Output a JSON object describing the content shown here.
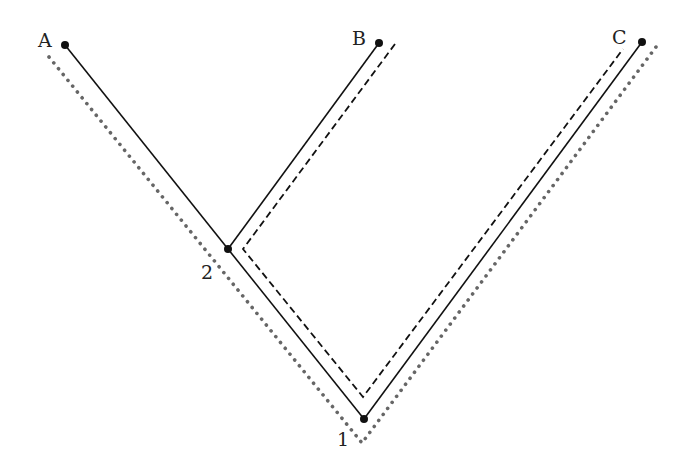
{
  "diagram": {
    "type": "phylogenetic-tree",
    "leaves": [
      {
        "id": "A",
        "label": "A",
        "x": 65,
        "y": 45
      },
      {
        "id": "B",
        "label": "B",
        "x": 379,
        "y": 43
      },
      {
        "id": "C",
        "label": "C",
        "x": 642,
        "y": 42
      }
    ],
    "internal_nodes": [
      {
        "id": "2",
        "label": "2",
        "x": 228,
        "y": 249
      },
      {
        "id": "1",
        "label": "1",
        "x": 364,
        "y": 419
      }
    ],
    "edges": [
      {
        "from": "1",
        "to": "2"
      },
      {
        "from": "2",
        "to": "A"
      },
      {
        "from": "2",
        "to": "B"
      },
      {
        "from": "1",
        "to": "C"
      }
    ],
    "paths": [
      {
        "style": "solid",
        "description": "tree branches",
        "color": "#111111"
      },
      {
        "style": "dashed",
        "description": "path B - 2 - 1 - C",
        "color": "#111111"
      },
      {
        "style": "dotted",
        "description": "path A - 2 - 1 - C",
        "color": "#666666"
      }
    ]
  }
}
